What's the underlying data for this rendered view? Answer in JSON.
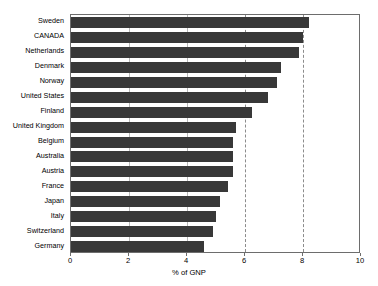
{
  "chart_data": {
    "type": "bar",
    "orientation": "horizontal",
    "title": "",
    "xlabel": "% of GNP",
    "ylabel": "",
    "xlim": [
      0,
      10
    ],
    "xticks": [
      0,
      2,
      4,
      6,
      8,
      10
    ],
    "xtick_labels": [
      "0",
      "2",
      "4",
      "6",
      "8",
      "10"
    ],
    "grid": true,
    "gridlines_solid": [
      2,
      4
    ],
    "gridlines_dashed": [
      6,
      8
    ],
    "legend": null,
    "bar_color": "#383838",
    "frame_color": "#6d6d6d",
    "categories": [
      "Sweden",
      "CANADA",
      "Netherlands",
      "Denmark",
      "Norway",
      "United States",
      "Finland",
      "United Kingdom",
      "Belgium",
      "Australia",
      "Austria",
      "France",
      "Japan",
      "Italy",
      "Switzerland",
      "Germany"
    ],
    "values": [
      8.2,
      8.0,
      7.85,
      7.25,
      7.1,
      6.8,
      6.25,
      5.7,
      5.6,
      5.6,
      5.6,
      5.4,
      5.15,
      5.0,
      4.9,
      4.6
    ]
  }
}
